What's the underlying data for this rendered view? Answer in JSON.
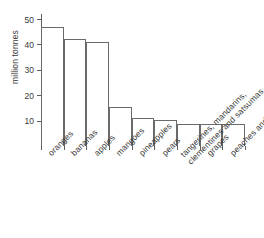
{
  "chart_data": {
    "type": "bar",
    "title": "",
    "xlabel": "",
    "ylabel": "million tonnes",
    "ylim": [
      0,
      52
    ],
    "yticks": [
      10,
      20,
      30,
      40,
      50
    ],
    "grid": false,
    "legend": null,
    "categories": [
      "oranges",
      "bananas",
      "apples",
      "mangoes",
      "pineapples",
      "pears",
      "tangerines, mandarins, clementines and satsumas",
      "grapes",
      "peaches and nectarines"
    ],
    "values": [
      47,
      42,
      41,
      15.2,
      11,
      10.3,
      8.7,
      8.6,
      8.5
    ],
    "units": "million tonnes"
  }
}
